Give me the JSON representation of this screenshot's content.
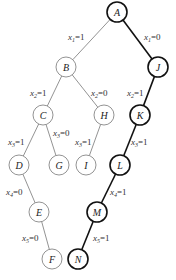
{
  "diagram": {
    "type": "search-tree",
    "nodes": [
      {
        "id": "A",
        "label": "A",
        "x": 117,
        "y": 12,
        "bold": true
      },
      {
        "id": "B",
        "label": "B",
        "x": 66,
        "y": 67,
        "bold": false
      },
      {
        "id": "J",
        "label": "J",
        "x": 158,
        "y": 67,
        "bold": true
      },
      {
        "id": "C",
        "label": "C",
        "x": 43,
        "y": 115,
        "bold": false
      },
      {
        "id": "H",
        "label": "H",
        "x": 104,
        "y": 115,
        "bold": false
      },
      {
        "id": "K",
        "label": "K",
        "x": 140,
        "y": 115,
        "bold": true
      },
      {
        "id": "D",
        "label": "D",
        "x": 19,
        "y": 165,
        "bold": false
      },
      {
        "id": "G",
        "label": "G",
        "x": 59,
        "y": 165,
        "bold": false
      },
      {
        "id": "I",
        "label": "I",
        "x": 86,
        "y": 165,
        "bold": false
      },
      {
        "id": "L",
        "label": "L",
        "x": 120,
        "y": 165,
        "bold": true
      },
      {
        "id": "E",
        "label": "E",
        "x": 39,
        "y": 212,
        "bold": false
      },
      {
        "id": "M",
        "label": "M",
        "x": 97,
        "y": 212,
        "bold": true
      },
      {
        "id": "F",
        "label": "F",
        "x": 52,
        "y": 259,
        "bold": false
      },
      {
        "id": "N",
        "label": "N",
        "x": 78,
        "y": 259,
        "bold": true
      }
    ],
    "edges": [
      {
        "from": "A",
        "to": "B",
        "var": "x",
        "sub": "1",
        "val": "=1",
        "lx": 68,
        "ly": 40,
        "bold": false
      },
      {
        "from": "A",
        "to": "J",
        "var": "x",
        "sub": "1",
        "val": "=0",
        "lx": 144,
        "ly": 40,
        "bold": true
      },
      {
        "from": "B",
        "to": "C",
        "var": "x",
        "sub": "2",
        "val": "=1",
        "lx": 30,
        "ly": 96,
        "bold": false
      },
      {
        "from": "B",
        "to": "H",
        "var": "x",
        "sub": "2",
        "val": "=0",
        "lx": 91,
        "ly": 96,
        "bold": false
      },
      {
        "from": "J",
        "to": "K",
        "var": "x",
        "sub": "2",
        "val": "=1",
        "lx": 127,
        "ly": 96,
        "bold": true
      },
      {
        "from": "C",
        "to": "D",
        "var": "x",
        "sub": "3",
        "val": "=1",
        "lx": 8,
        "ly": 145,
        "bold": false
      },
      {
        "from": "C",
        "to": "G",
        "var": "x",
        "sub": "3",
        "val": "=0",
        "lx": 53,
        "ly": 136,
        "bold": false
      },
      {
        "from": "H",
        "to": "I",
        "var": "x",
        "sub": "3",
        "val": "=1",
        "lx": 75,
        "ly": 145,
        "bold": false
      },
      {
        "from": "K",
        "to": "L",
        "var": "x",
        "sub": "3",
        "val": "=1",
        "lx": 131,
        "ly": 145,
        "bold": true
      },
      {
        "from": "D",
        "to": "E",
        "var": "x",
        "sub": "4",
        "val": "=0",
        "lx": 6,
        "ly": 195,
        "bold": false
      },
      {
        "from": "L",
        "to": "M",
        "var": "x",
        "sub": "4",
        "val": "=1",
        "lx": 110,
        "ly": 195,
        "bold": true
      },
      {
        "from": "E",
        "to": "F",
        "var": "x",
        "sub": "5",
        "val": "=0",
        "lx": 22,
        "ly": 241,
        "bold": false
      },
      {
        "from": "M",
        "to": "N",
        "var": "x",
        "sub": "5",
        "val": "=1",
        "lx": 93,
        "ly": 241,
        "bold": true
      }
    ],
    "colors": {
      "line": "#777777",
      "bold_line": "#111111",
      "node_fill": "#ffffff"
    }
  }
}
